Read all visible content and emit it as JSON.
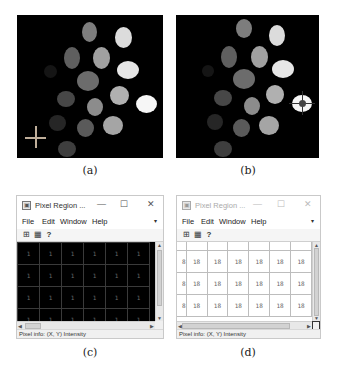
{
  "panels": {
    "a": {
      "caption": "(a)",
      "crosshair": {
        "color": "#bfae9a",
        "location": "lower-left, background"
      }
    },
    "b": {
      "caption": "(b)",
      "crosshair": {
        "color": "#333333",
        "location": "right brightest blob"
      }
    },
    "c": {
      "caption": "(c)",
      "window": {
        "title": "Pixel Region ...",
        "state": "active",
        "controls": {
          "minimize": "—",
          "maximize": "☐",
          "close": "✕"
        },
        "menu": [
          "File",
          "Edit",
          "Window",
          "Help"
        ],
        "dock_icon": "▾",
        "toolbar_icons": [
          "pixel-grid-icon",
          "copy-icon",
          "help-icon"
        ],
        "grid": {
          "background": "#000000",
          "rows": [
            [
              "1",
              "1",
              "1",
              "1",
              "1",
              "1"
            ],
            [
              "1",
              "1",
              "1",
              "1",
              "1",
              "1"
            ],
            [
              "1",
              "1",
              "1",
              "1",
              "1",
              "1"
            ],
            [
              "1",
              "1",
              "1",
              "1",
              "1",
              "1"
            ]
          ]
        },
        "status": "Pixel info: (X, Y) Intensity"
      }
    },
    "d": {
      "caption": "(d)",
      "window": {
        "title": "Pixel Region ...",
        "state": "inactive",
        "controls": {
          "minimize": "—",
          "maximize": "☐",
          "close": "✕"
        },
        "menu": [
          "File",
          "Edit",
          "Window",
          "Help"
        ],
        "dock_icon": "▾",
        "toolbar_icons": [
          "pixel-grid-icon",
          "copy-icon",
          "help-icon"
        ],
        "grid": {
          "background": "#ffffff",
          "header_row": [
            "",
            "",
            "",
            "",
            "",
            "",
            ""
          ],
          "rows": [
            [
              "8",
              "18",
              "18",
              "18",
              "18",
              "18",
              "18"
            ],
            [
              "8",
              "18",
              "18",
              "18",
              "18",
              "18",
              "18"
            ],
            [
              "8",
              "18",
              "18",
              "18",
              "18",
              "18",
              "18"
            ]
          ]
        },
        "status": "Pixel info: (X, Y) Intensity"
      }
    }
  },
  "icons": {
    "app": "▣",
    "pixel_grid": "⊞",
    "copy": "▦",
    "help": "?",
    "scroll_up": "▲",
    "scroll_down": "▼",
    "scroll_left": "◀",
    "scroll_right": "▶"
  }
}
